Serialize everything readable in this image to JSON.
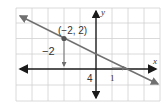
{
  "figure": {
    "type": "coordinate-graph",
    "grid": {
      "x_min": -5,
      "x_max": 4,
      "y_min": -2,
      "y_max": 4,
      "step": 1
    },
    "axes": {
      "x_label": "x",
      "y_label": "y"
    },
    "line": {
      "equation": "y = -1/2 x + 1",
      "slope": -0.5,
      "y_intercept": 1,
      "x_intercept": 2
    },
    "point": {
      "x": -2,
      "y": 2,
      "label": "(−2, 2)"
    },
    "annotations": {
      "vertical_change_label": "−2",
      "horizontal_change_label": "4",
      "run_label": "1"
    },
    "colors": {
      "grid": "#d0d0d0",
      "axis": "#1a1a1a",
      "line": "#707070",
      "point": "#555555"
    }
  }
}
